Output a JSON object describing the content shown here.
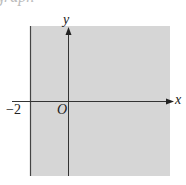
{
  "header_fragment": "graph",
  "diagram": {
    "type": "coordinate-plane-shaded-region",
    "region": "x >= -2",
    "labels": {
      "x_axis": "x",
      "y_axis": "y",
      "origin": "O",
      "boundary_tick": "−2"
    },
    "colors": {
      "shade": "#d6d6d6",
      "axis": "#333333",
      "boundary": "#444444"
    }
  }
}
